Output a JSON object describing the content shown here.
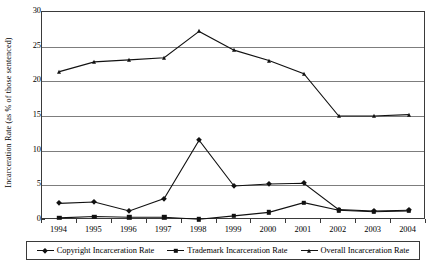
{
  "chart_data": {
    "type": "line",
    "title": "",
    "xlabel": "",
    "ylabel": "Incarceration Rate (as % of those sentenced)",
    "categories": [
      "1994",
      "1995",
      "1996",
      "1997",
      "1998",
      "1999",
      "2000",
      "2001",
      "2002",
      "2003",
      "2004"
    ],
    "x": [
      1994,
      1995,
      1996,
      1997,
      1998,
      1999,
      2000,
      2001,
      2002,
      2003,
      2004
    ],
    "ylim": [
      0,
      30
    ],
    "yticks": [
      0,
      5,
      10,
      15,
      20,
      25,
      30
    ],
    "ytick_labels": [
      "0",
      "5",
      "10",
      "15",
      "20",
      "25",
      "30"
    ],
    "grid": "horizontal",
    "legend_position": "bottom",
    "series": [
      {
        "name": "Copyright Incarceration Rate",
        "marker": "diamond",
        "color": "#111111",
        "values": [
          2.4,
          2.6,
          1.3,
          3.1,
          11.5,
          4.9,
          5.2,
          5.3,
          1.5,
          1.3,
          1.4
        ]
      },
      {
        "name": "Trademark Incarceration Rate",
        "marker": "square",
        "color": "#111111",
        "values": [
          0.3,
          0.5,
          0.4,
          0.4,
          0.1,
          0.6,
          1.1,
          2.5,
          1.4,
          1.2,
          1.3
        ]
      },
      {
        "name": "Overall Incarceration Rate",
        "marker": "triangle",
        "color": "#111111",
        "values": [
          21.4,
          22.8,
          23.1,
          23.4,
          27.2,
          24.5,
          23.0,
          21.1,
          15.0,
          15.0,
          15.2
        ]
      }
    ]
  },
  "axes": {
    "y_title": "Incarceration Rate (as % of those sentenced)"
  }
}
